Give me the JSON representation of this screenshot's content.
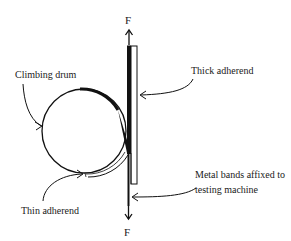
{
  "diagram": {
    "labels": {
      "climbing_drum": "Climbing drum",
      "thick_adherend": "Thick adherend",
      "thin_adherend": "Thin adherend",
      "metal_bands_line1": "Metal bands affixed to",
      "metal_bands_line2": "testing machine"
    },
    "forces": {
      "top": "F",
      "bottom": "F"
    },
    "colors": {
      "stroke": "#111111",
      "background": "#ffffff"
    }
  }
}
